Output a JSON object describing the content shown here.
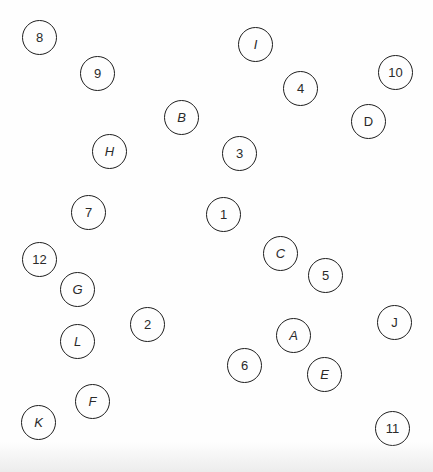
{
  "diagram": {
    "top_fragment_text": "",
    "node_radius_px": 18,
    "stroke_color": "#1e1e1e",
    "text_color": "#2a2a2a",
    "nodes": [
      {
        "id": "8",
        "label": "8",
        "kind": "number",
        "italic": false,
        "x": 40,
        "y": 38
      },
      {
        "id": "9",
        "label": "9",
        "kind": "number",
        "italic": false,
        "x": 98,
        "y": 74
      },
      {
        "id": "I",
        "label": "I",
        "kind": "letter",
        "italic": true,
        "x": 256,
        "y": 45
      },
      {
        "id": "4",
        "label": "4",
        "kind": "number",
        "italic": false,
        "x": 301,
        "y": 89
      },
      {
        "id": "10",
        "label": "10",
        "kind": "number",
        "italic": false,
        "x": 396,
        "y": 73
      },
      {
        "id": "B",
        "label": "B",
        "kind": "letter",
        "italic": true,
        "x": 182,
        "y": 118
      },
      {
        "id": "D",
        "label": "D",
        "kind": "letter",
        "italic": false,
        "x": 369,
        "y": 122
      },
      {
        "id": "H",
        "label": "H",
        "kind": "letter",
        "italic": true,
        "x": 110,
        "y": 152
      },
      {
        "id": "3",
        "label": "3",
        "kind": "number",
        "italic": false,
        "x": 240,
        "y": 154
      },
      {
        "id": "7",
        "label": "7",
        "kind": "number",
        "italic": false,
        "x": 89,
        "y": 213
      },
      {
        "id": "1",
        "label": "1",
        "kind": "number",
        "italic": false,
        "x": 224,
        "y": 215
      },
      {
        "id": "C",
        "label": "C",
        "kind": "letter",
        "italic": true,
        "x": 281,
        "y": 254
      },
      {
        "id": "12",
        "label": "12",
        "kind": "number",
        "italic": false,
        "x": 40,
        "y": 260
      },
      {
        "id": "5",
        "label": "5",
        "kind": "number",
        "italic": false,
        "x": 326,
        "y": 276
      },
      {
        "id": "G",
        "label": "G",
        "kind": "letter",
        "italic": true,
        "x": 78,
        "y": 290
      },
      {
        "id": "J",
        "label": "J",
        "kind": "letter",
        "italic": false,
        "x": 395,
        "y": 323
      },
      {
        "id": "2",
        "label": "2",
        "kind": "number",
        "italic": false,
        "x": 148,
        "y": 325
      },
      {
        "id": "A",
        "label": "A",
        "kind": "letter",
        "italic": true,
        "x": 294,
        "y": 336
      },
      {
        "id": "L",
        "label": "L",
        "kind": "letter",
        "italic": true,
        "x": 78,
        "y": 342
      },
      {
        "id": "6",
        "label": "6",
        "kind": "number",
        "italic": false,
        "x": 245,
        "y": 366
      },
      {
        "id": "E",
        "label": "E",
        "kind": "letter",
        "italic": true,
        "x": 325,
        "y": 375
      },
      {
        "id": "F",
        "label": "F",
        "kind": "letter",
        "italic": true,
        "x": 93,
        "y": 402
      },
      {
        "id": "K",
        "label": "K",
        "kind": "letter",
        "italic": true,
        "x": 39,
        "y": 423
      },
      {
        "id": "11",
        "label": "11",
        "kind": "number",
        "italic": false,
        "x": 393,
        "y": 429
      }
    ]
  }
}
